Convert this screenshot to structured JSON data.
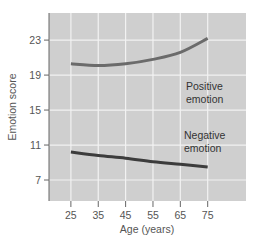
{
  "chart_data": {
    "type": "line",
    "title": "",
    "xlabel": "Age (years)",
    "ylabel": "Emotion score",
    "x": [
      25,
      35,
      45,
      55,
      65,
      75
    ],
    "x_ticks": [
      "25",
      "35",
      "45",
      "55",
      "65",
      "75"
    ],
    "y_ticks": [
      "23",
      "19",
      "15",
      "11",
      "7"
    ],
    "xlim": [
      17,
      89
    ],
    "ylim": [
      4.6,
      26.1
    ],
    "grid": true,
    "legend": "inline labels",
    "series": [
      {
        "name": "Positive emotion",
        "label_lines": [
          "Positive",
          "emotion"
        ],
        "values": [
          20.3,
          20.1,
          20.3,
          20.8,
          21.6,
          23.2
        ],
        "color": "#6b6b6b"
      },
      {
        "name": "Negative emotion",
        "label_lines": [
          "Negative",
          "emotion"
        ],
        "values": [
          10.2,
          9.8,
          9.5,
          9.1,
          8.8,
          8.5
        ],
        "color": "#3c3c3c"
      }
    ]
  },
  "colors": {
    "plot_background": "#cfcfcf",
    "grid": "#f2f2f2",
    "axis": "#666666"
  }
}
